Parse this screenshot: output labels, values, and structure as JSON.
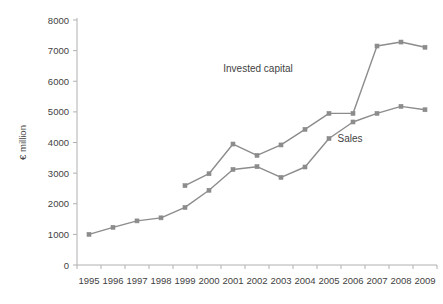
{
  "chart_data": {
    "type": "line",
    "title": "",
    "xlabel": "",
    "ylabel": "€ million",
    "categories": [
      "1995",
      "1996",
      "1997",
      "1998",
      "1999",
      "2000",
      "2001",
      "2002",
      "2003",
      "2004",
      "2005",
      "2006",
      "2007",
      "2008",
      "2009"
    ],
    "ylim": [
      0,
      8000
    ],
    "ytick_labels": [
      "0",
      "1000",
      "2000",
      "3000",
      "4000",
      "5000",
      "6000",
      "7000",
      "8000"
    ],
    "ytick_values": [
      0,
      1000,
      2000,
      3000,
      4000,
      5000,
      6000,
      7000,
      8000
    ],
    "grid": false,
    "legend": "inline-annotations",
    "series": [
      {
        "name": "Invested capital",
        "label_text": "Invested capital",
        "color": "#8c8c8c",
        "marker": "square",
        "values": [
          null,
          null,
          null,
          null,
          2590,
          2980,
          3950,
          3580,
          3920,
          4430,
          4950,
          4950,
          7150,
          7280,
          7110
        ]
      },
      {
        "name": "Sales",
        "label_text": "Sales",
        "color": "#8c8c8c",
        "marker": "square",
        "values": [
          1000,
          1230,
          1440,
          1540,
          1880,
          2440,
          3120,
          3210,
          2860,
          3200,
          4130,
          4670,
          4950,
          5180,
          5070
        ]
      }
    ],
    "annotations": [
      {
        "text": "Invested capital",
        "x_px": 258,
        "y_px": 72
      },
      {
        "text": "Sales",
        "x_px": 350,
        "y_px": 142
      }
    ],
    "colors": {
      "line": "#8c8c8c",
      "marker": "#8c8c8c",
      "axis": "#b0b0b0",
      "text": "#3f3f3f",
      "background": "#ffffff"
    }
  }
}
